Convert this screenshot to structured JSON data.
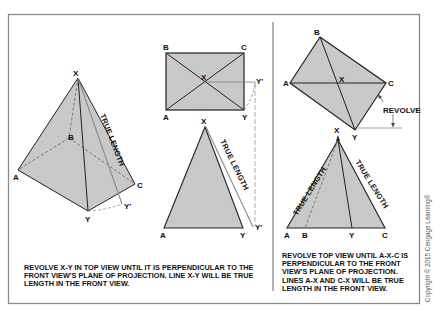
{
  "left_panel": {
    "pyramid_labels": {
      "x": "X",
      "a": "A",
      "b": "B",
      "c": "C",
      "y": "Y",
      "y_prime": "Y'"
    },
    "pyramid_true_length": "TRUE LENGTH",
    "top_view_labels": {
      "a": "A",
      "b": "B",
      "c": "C",
      "x": "X",
      "y": "Y",
      "y_prime": "Y'"
    },
    "front_view_labels": {
      "x": "X",
      "a": "A",
      "y": "Y",
      "y_prime": "Y'"
    },
    "front_view_true_length": "TRUE LENGTH",
    "caption": "REVOLVE X-Y IN TOP VIEW UNTIL IT IS PERPENDICULAR TO THE FRONT VIEW'S PLANE OF PROJECTION. LINE X-Y WILL BE TRUE LENGTH IN THE FRONT VIEW."
  },
  "right_panel": {
    "top_view_labels": {
      "a": "A",
      "b": "B",
      "c": "C",
      "x": "X",
      "y": "Y"
    },
    "revolve_label": "REVOLVE",
    "front_view_labels": {
      "x": "X",
      "a": "A",
      "b": "B",
      "y": "Y",
      "c": "C"
    },
    "true_length_left": "TRUE LENGTH",
    "true_length_right": "TRUE LENGTH",
    "caption": "REVOLVE TOP VIEW UNTIL A-X-C IS PERPENDICULAR TO THE FRONT VIEW'S PLANE OF PROJECTION. LINES A-X AND C-X WILL BE TRUE LENGTH IN THE FRONT VIEW."
  },
  "copyright": "Copyright © 2015 Cengage Learning®",
  "colors": {
    "fill": "#c9c9c9",
    "line": "#222222",
    "frame": "#8a8a8a",
    "construction": "#8a8a8a"
  }
}
